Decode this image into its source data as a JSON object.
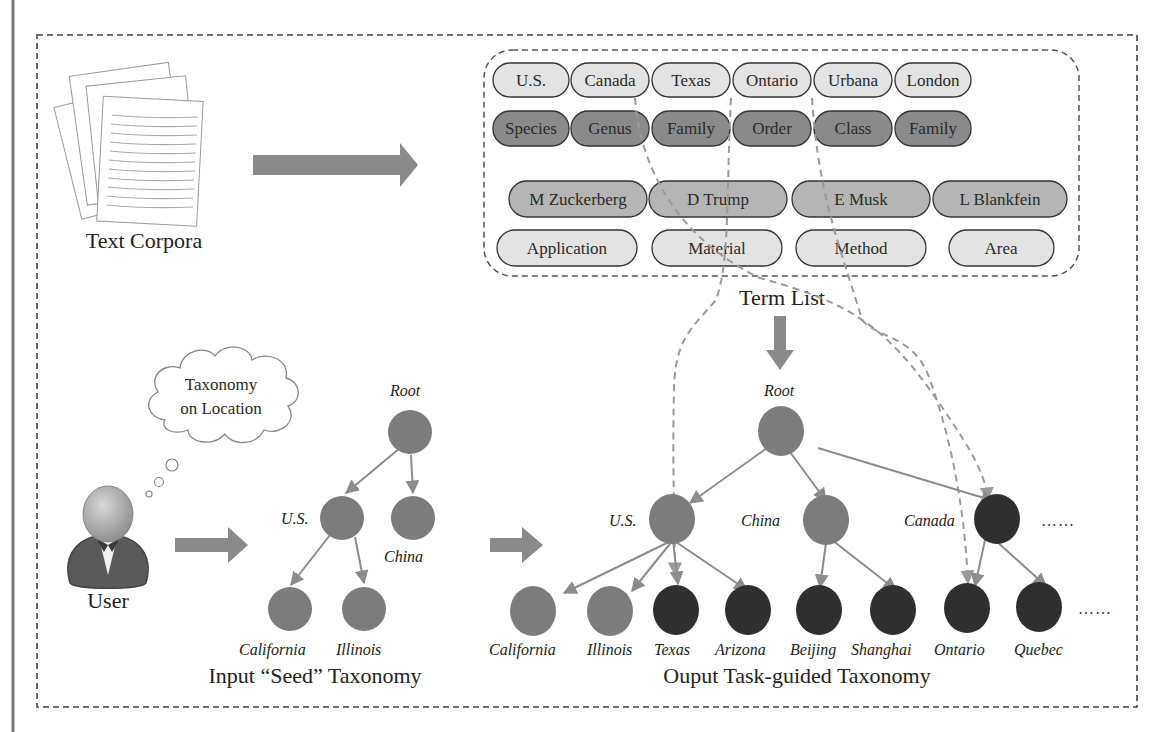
{
  "text_corpora": {
    "caption": "Text Corpora"
  },
  "term_list": {
    "caption": "Term List",
    "rows": [
      {
        "style": "light",
        "terms": [
          "U.S.",
          "Canada",
          "Texas",
          "Ontario",
          "Urbana",
          "London"
        ]
      },
      {
        "style": "dark",
        "terms": [
          "Species",
          "Genus",
          "Family",
          "Order",
          "Class",
          "Family"
        ]
      },
      {
        "style": "mid",
        "terms": [
          "M Zuckerberg",
          "D Trump",
          "E Musk",
          "L Blankfein"
        ]
      },
      {
        "style": "light",
        "terms": [
          "Application",
          "Material",
          "Method",
          "Area"
        ]
      }
    ]
  },
  "user": {
    "label": "User",
    "thought_line1": "Taxonomy",
    "thought_line2": "on Location"
  },
  "input_taxonomy": {
    "caption": "Input “Seed” Taxonomy",
    "nodes": {
      "root": "Root",
      "us": "U.S.",
      "china": "China",
      "california": "California",
      "illinois": "Illinois"
    }
  },
  "output_taxonomy": {
    "caption": "Ouput Task-guided Taxonomy",
    "nodes": {
      "root": "Root",
      "us": "U.S.",
      "china": "China",
      "canada": "Canada",
      "california": "California",
      "illinois": "Illinois",
      "texas": "Texas",
      "arizona": "Arizona",
      "beijing": "Beijing",
      "shanghai": "Shanghai",
      "ontario": "Ontario",
      "quebec": "Quebec"
    },
    "ellipsis": "……"
  },
  "colors": {
    "seed_node": "#7c7c7c",
    "new_node": "#2f2f2f",
    "pill_light": "#e3e3e3",
    "pill_mid": "#b5b5b5",
    "pill_dark": "#8a8a8a",
    "arrow": "#8a8a8a",
    "edge": "#8c8c8c",
    "dashed_link": "#9a9a9a"
  }
}
